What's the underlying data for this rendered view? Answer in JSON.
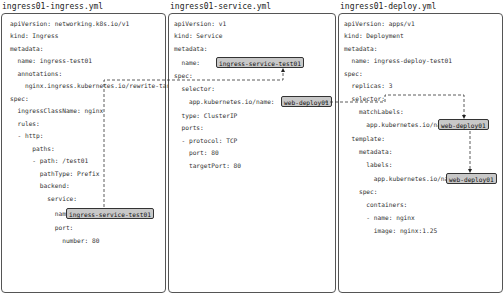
{
  "panels": [
    {
      "title": "ingress01-ingress.yml",
      "lines": [
        "apiVersion: networking.k8s.io/v1",
        "kind: Ingress",
        "metadata:",
        "  name: ingress-test01",
        "  annotations:",
        "    nginx.ingress.kubernetes.io/rewrite-target: /",
        "spec:",
        "  ingressClassName: nginx",
        "  rules:",
        "  - http:",
        "      paths:",
        "      - path: /test01",
        "        pathType: Prefix",
        "        backend:",
        "          service:",
        "            name:",
        "            port:",
        "              number: 80"
      ],
      "highlight": "ingress-service-test01"
    },
    {
      "title": "ingress01-service.yml",
      "lines": [
        "apiVersion: v1",
        "kind: Service",
        "metadata:",
        "  name:",
        "spec:",
        "  selector:",
        "    app.kubernetes.io/name:",
        "  type: ClusterIP",
        "  ports:",
        "  - protocol: TCP",
        "    port: 80",
        "    targetPort: 80"
      ],
      "highlight_name": "ingress-service-test01",
      "highlight_selector": "web-deploy01"
    },
    {
      "title": "ingress01-deploy.yml",
      "lines": [
        "apiVersion: apps/v1",
        "kind: Deployment",
        "metadata:",
        "  name: ingress-deploy-test01",
        "spec:",
        "  replicas: 3",
        "  selector:",
        "    matchLabels:",
        "      app.kubernetes.io/name:",
        "  template:",
        "    metadata:",
        "      labels:",
        "        app.kubernetes.io/name:",
        "    spec:",
        "      containers:",
        "      - name: nginx",
        "        image: nginx:1.25"
      ],
      "highlight_match": "web-deploy01",
      "highlight_label": "web-deploy01"
    }
  ],
  "colors": {
    "highlight_bg": "#c8c8c8",
    "border": "#555555",
    "connector": "#333333"
  }
}
